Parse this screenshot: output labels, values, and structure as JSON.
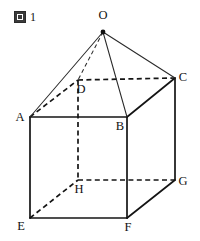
{
  "figure": {
    "caption_mark": "図",
    "caption_number": "1",
    "type": "solid-geometry-diagram",
    "shape": "cuboid with apex pyramid",
    "colors": {
      "background": "#ffffff",
      "edge": "#141414",
      "thin_edge": "#2a2a2a",
      "label": "#111111"
    }
  },
  "vertices": {
    "O": {
      "label": "O",
      "x": 103,
      "y": 32,
      "label_x": 103,
      "label_y": 19,
      "dot": true
    },
    "A": {
      "label": "A",
      "x": 30,
      "y": 117,
      "label_x": 20,
      "label_y": 121,
      "dot": false
    },
    "B": {
      "label": "B",
      "x": 127,
      "y": 117,
      "label_x": 120,
      "label_y": 130,
      "dot": false
    },
    "C": {
      "label": "C",
      "x": 175,
      "y": 78,
      "label_x": 183,
      "label_y": 81,
      "dot": false
    },
    "D": {
      "label": "D",
      "x": 78,
      "y": 80,
      "label_x": 81,
      "label_y": 93,
      "dot": false
    },
    "E": {
      "label": "E",
      "x": 30,
      "y": 218,
      "label_x": 21,
      "label_y": 230,
      "dot": false
    },
    "F": {
      "label": "F",
      "x": 127,
      "y": 218,
      "label_x": 128,
      "label_y": 231,
      "dot": false
    },
    "G": {
      "label": "G",
      "x": 175,
      "y": 180,
      "label_x": 183,
      "label_y": 185,
      "dot": false
    },
    "H": {
      "label": "H",
      "x": 78,
      "y": 180,
      "label_x": 79,
      "label_y": 193,
      "dot": false
    }
  },
  "edges": [
    {
      "name": "edge-AB",
      "from": "A",
      "to": "B",
      "style": "solid"
    },
    {
      "name": "edge-BF",
      "from": "B",
      "to": "F",
      "style": "solid"
    },
    {
      "name": "edge-FE",
      "from": "F",
      "to": "E",
      "style": "solid"
    },
    {
      "name": "edge-EA",
      "from": "E",
      "to": "A",
      "style": "solid"
    },
    {
      "name": "edge-BC",
      "from": "B",
      "to": "C",
      "style": "solid"
    },
    {
      "name": "edge-CG",
      "from": "C",
      "to": "G",
      "style": "solid"
    },
    {
      "name": "edge-GF",
      "from": "G",
      "to": "F",
      "style": "solid"
    },
    {
      "name": "edge-AD",
      "from": "A",
      "to": "D",
      "style": "dashed"
    },
    {
      "name": "edge-DC",
      "from": "D",
      "to": "C",
      "style": "dashed"
    },
    {
      "name": "edge-DH",
      "from": "D",
      "to": "H",
      "style": "dashed"
    },
    {
      "name": "edge-HG",
      "from": "H",
      "to": "G",
      "style": "dashed"
    },
    {
      "name": "edge-EH",
      "from": "E",
      "to": "H",
      "style": "dashed"
    },
    {
      "name": "edge-OA",
      "from": "O",
      "to": "A",
      "style": "thin"
    },
    {
      "name": "edge-OB",
      "from": "O",
      "to": "B",
      "style": "thin"
    },
    {
      "name": "edge-OC",
      "from": "O",
      "to": "C",
      "style": "thin"
    },
    {
      "name": "edge-OD",
      "from": "O",
      "to": "D",
      "style": "dashed-thin"
    }
  ]
}
